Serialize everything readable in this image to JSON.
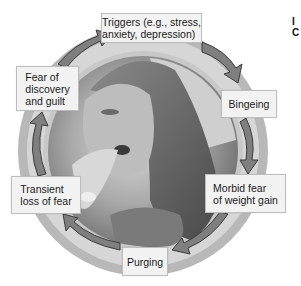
{
  "diagram": {
    "type": "cycle",
    "center_image": "photo-woman-eating",
    "colors": {
      "ring_outer": "#b8b8b8",
      "ring_inner": "#d6d6d6",
      "arrow_fill": "#7f7f7f",
      "arrow_edge": "#3c3c3c",
      "box_fill": "#f2f2f2",
      "box_border": "#bdbdbd"
    },
    "steps": [
      {
        "label": "Triggers (e.g., stress,\nanxiety, depression)"
      },
      {
        "label": "Bingeing"
      },
      {
        "label": "Morbid fear\nof weight gain"
      },
      {
        "label": "Purging"
      },
      {
        "label": "Transient\nloss of fear"
      },
      {
        "label": "Fear of\ndiscovery\nand guilt"
      }
    ],
    "cut_off_text": "I\nC"
  }
}
